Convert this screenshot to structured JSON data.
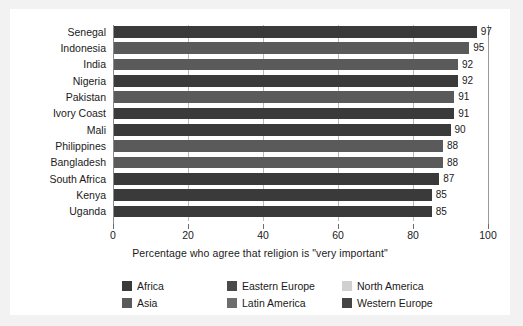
{
  "chart_data": {
    "type": "bar",
    "orientation": "horizontal",
    "title": "",
    "xlabel": "Percentage who agree that religion is \"very important\"",
    "ylabel": "",
    "xlim": [
      0,
      100
    ],
    "xticks": [
      0,
      20,
      40,
      60,
      80,
      100
    ],
    "grid": true,
    "legend_position": "bottom",
    "categories": [
      "Senegal",
      "Indonesia",
      "India",
      "Nigeria",
      "Pakistan",
      "Ivory Coast",
      "Mali",
      "Philippines",
      "Bangladesh",
      "South Africa",
      "Kenya",
      "Uganda"
    ],
    "values": [
      97,
      95,
      92,
      92,
      91,
      91,
      90,
      88,
      88,
      87,
      85,
      85
    ],
    "point_regions": [
      "Africa",
      "Asia",
      "Asia",
      "Africa",
      "Asia",
      "Africa",
      "Africa",
      "Asia",
      "Asia",
      "Africa",
      "Africa",
      "Africa"
    ],
    "bars": [
      {
        "label": "Senegal",
        "value": 97,
        "region": "Africa",
        "color": "#3a3a3a"
      },
      {
        "label": "Indonesia",
        "value": 95,
        "region": "Asia",
        "color": "#5a5a5a"
      },
      {
        "label": "India",
        "value": 92,
        "region": "Asia",
        "color": "#5a5a5a"
      },
      {
        "label": "Nigeria",
        "value": 92,
        "region": "Africa",
        "color": "#3a3a3a"
      },
      {
        "label": "Pakistan",
        "value": 91,
        "region": "Asia",
        "color": "#5a5a5a"
      },
      {
        "label": "Ivory Coast",
        "value": 91,
        "region": "Africa",
        "color": "#3a3a3a"
      },
      {
        "label": "Mali",
        "value": 90,
        "region": "Africa",
        "color": "#3a3a3a"
      },
      {
        "label": "Philippines",
        "value": 88,
        "region": "Asia",
        "color": "#5a5a5a"
      },
      {
        "label": "Bangladesh",
        "value": 88,
        "region": "Asia",
        "color": "#5a5a5a"
      },
      {
        "label": "South Africa",
        "value": 87,
        "region": "Africa",
        "color": "#3a3a3a"
      },
      {
        "label": "Kenya",
        "value": 85,
        "region": "Africa",
        "color": "#3a3a3a"
      },
      {
        "label": "Uganda",
        "value": 85,
        "region": "Africa",
        "color": "#3a3a3a"
      }
    ],
    "legend": [
      {
        "label": "Africa",
        "color": "#3a3a3a"
      },
      {
        "label": "Asia",
        "color": "#5a5a5a"
      },
      {
        "label": "Eastern Europe",
        "color": "#4a4a4a"
      },
      {
        "label": "Latin America",
        "color": "#6d6d6d"
      },
      {
        "label": "North America",
        "color": "#d0d0d0"
      },
      {
        "label": "Western Europe",
        "color": "#444444"
      }
    ]
  }
}
